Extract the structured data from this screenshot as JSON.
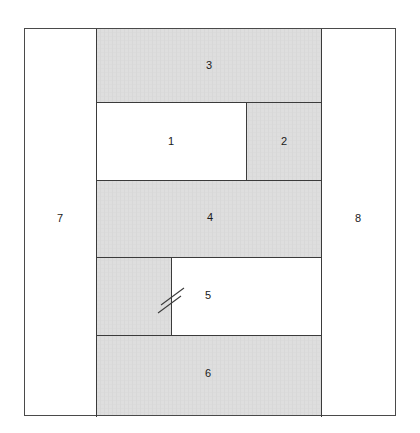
{
  "diagram": {
    "canvas": {
      "width": 420,
      "height": 433,
      "background": "#ffffff"
    },
    "frame": {
      "x": 24,
      "y": 28,
      "width": 371,
      "height": 387,
      "stroke": "#4a4a4a",
      "stroke_width": 1.6,
      "fill": "#ffffff"
    },
    "colors": {
      "hatch_fill": "#dedede",
      "hatch_line": "#cfcfcf",
      "plain_fill": "#ffffff",
      "outline": "#4a4a4a",
      "divider": "#3b3b3b",
      "label_text": "#1a1a1a"
    },
    "regions": [
      {
        "id": "region-1",
        "label": "1",
        "fill": "plain",
        "x": 96,
        "y": 102,
        "width": 150,
        "height": 78,
        "label_x": 171,
        "label_y": 142
      },
      {
        "id": "region-2",
        "label": "2",
        "fill": "hatch",
        "x": 246,
        "y": 102,
        "width": 75,
        "height": 78,
        "label_x": 284,
        "label_y": 142
      },
      {
        "id": "region-3",
        "label": "3",
        "fill": "hatch",
        "x": 96,
        "y": 28,
        "width": 225,
        "height": 74,
        "label_x": 209,
        "label_y": 66
      },
      {
        "id": "region-4",
        "label": "4",
        "fill": "hatch",
        "x": 96,
        "y": 180,
        "width": 225,
        "height": 77,
        "label_x": 210,
        "label_y": 218
      },
      {
        "id": "region-5-stub",
        "label": "",
        "fill": "hatch",
        "x": 96,
        "y": 257,
        "width": 75,
        "height": 78,
        "label_x": 0,
        "label_y": 0
      },
      {
        "id": "region-5",
        "label": "5",
        "fill": "plain",
        "x": 171,
        "y": 257,
        "width": 150,
        "height": 78,
        "label_x": 208,
        "label_y": 296
      },
      {
        "id": "region-6",
        "label": "6",
        "fill": "hatch",
        "x": 96,
        "y": 335,
        "width": 225,
        "height": 81,
        "label_x": 208,
        "label_y": 374
      },
      {
        "id": "region-7",
        "label": "7",
        "fill": "plain",
        "x": 24,
        "y": 28,
        "width": 72,
        "height": 387,
        "label_x": 60,
        "label_y": 219
      },
      {
        "id": "region-8",
        "label": "8",
        "fill": "plain",
        "x": 321,
        "y": 28,
        "width": 74,
        "height": 387,
        "label_x": 358,
        "label_y": 219
      }
    ],
    "dividers": [
      {
        "id": "divider-col-left",
        "x1": 96,
        "y1": 28,
        "x2": 96,
        "y2": 416
      },
      {
        "id": "divider-col-right",
        "x1": 321,
        "y1": 28,
        "x2": 321,
        "y2": 416
      },
      {
        "id": "divider-3-bottom",
        "x1": 96,
        "y1": 102,
        "x2": 321,
        "y2": 102
      },
      {
        "id": "divider-1-2",
        "x1": 246,
        "y1": 102,
        "x2": 246,
        "y2": 180
      },
      {
        "id": "divider-1-bottom",
        "x1": 96,
        "y1": 180,
        "x2": 321,
        "y2": 180
      },
      {
        "id": "divider-4-bottom",
        "x1": 96,
        "y1": 257,
        "x2": 321,
        "y2": 257
      },
      {
        "id": "divider-5-left",
        "x1": 171,
        "y1": 257,
        "x2": 171,
        "y2": 335
      },
      {
        "id": "divider-5-bottom",
        "x1": 96,
        "y1": 335,
        "x2": 321,
        "y2": 335
      }
    ],
    "break_symbol": {
      "id": "break-symbol",
      "name": "break-slash-marks",
      "description": "Two parallel diagonal slash marks crossing the divider at the left edge of region 5",
      "slashes": [
        {
          "x1": 161,
          "y1": 305,
          "x2": 184,
          "y2": 288
        },
        {
          "x1": 158,
          "y1": 313,
          "x2": 181,
          "y2": 296
        }
      ]
    }
  }
}
